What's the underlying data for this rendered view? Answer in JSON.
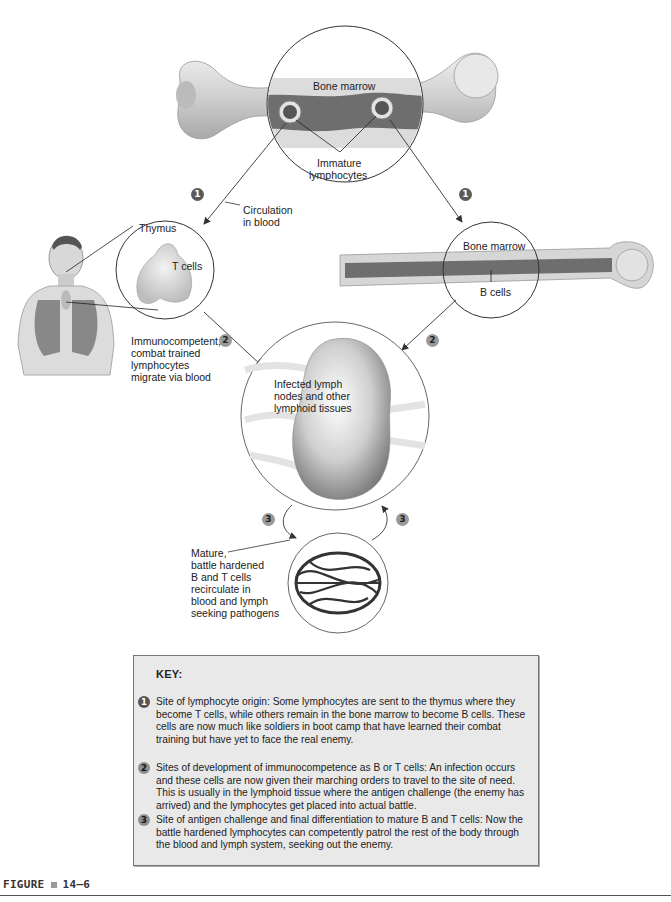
{
  "diagram": {
    "top_bone": {
      "label_marrow": "Bone marrow",
      "label_cells": "Immature",
      "label_cells_2": "lymphocytes"
    },
    "path_left": {
      "marker": "1",
      "label_line1": "Circulation",
      "label_line2": "in blood"
    },
    "thymus": {
      "label": "Thymus",
      "cells_label": "T cells"
    },
    "right_bone": {
      "marker": "1",
      "label_marrow": "Bone marrow",
      "label_cells": "B cells"
    },
    "migration": {
      "marker_left": "2",
      "marker_right": "2",
      "lines": [
        "Immunocompetent,",
        "combat trained",
        "lymphocytes",
        "migrate via blood"
      ]
    },
    "lymph_node": {
      "lines": [
        "Infected lymph",
        "nodes and other",
        "lymphoid tissues"
      ]
    },
    "recirculation": {
      "marker_left": "3",
      "marker_right": "3",
      "lines": [
        "Mature,",
        "battle hardened",
        "B and T cells",
        "recirculate in",
        "blood and lymph",
        "seeking pathogens"
      ]
    }
  },
  "key": {
    "title": "KEY:",
    "items": [
      {
        "num": "1",
        "text": "Site of lymphocyte origin: Some lymphocytes are sent to the thymus where they become T cells, while others remain in the bone marrow to become B cells.  These cells are now much like soldiers in boot camp that have learned their combat training but have yet to face the real enemy."
      },
      {
        "num": "2",
        "text": "Sites of development of immunocompetence as B or T cells: An infection occurs and these cells are now given their marching orders to travel to the site of need.  This is usually in the lymphoid tissue where the antigen challenge (the enemy has arrived) and the lymphocytes get placed into actual battle."
      },
      {
        "num": "3",
        "text": "Site of antigen challenge and final differentiation to mature B and T cells: Now the battle hardened lymphocytes can competently patrol the rest of the body through the blood and lymph system, seeking out the enemy."
      }
    ]
  },
  "figure": {
    "label": "FIGURE",
    "number": "14–6"
  },
  "colors": {
    "bone": "#d9d9d9",
    "marrow": "#6e6e6e",
    "key_background": "#e9e9e9",
    "marker_dark": "#5a5a5a",
    "marker_light": "#9a9a9a"
  }
}
